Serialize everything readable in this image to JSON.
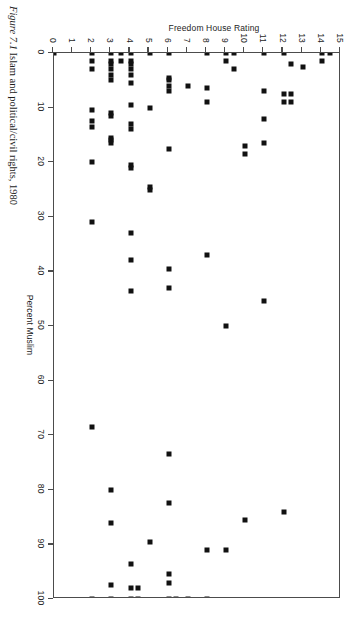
{
  "figure": {
    "caption_label": "Figure 7.1",
    "caption_text": "Islam and political/civil rights, 1980"
  },
  "chart_data": {
    "type": "scatter",
    "title": "",
    "xlabel": "Percent Muslim",
    "ylabel": "Freedom House Rating",
    "xlim": [
      0,
      100
    ],
    "ylim": [
      0,
      15
    ],
    "xticks": [
      0,
      10,
      20,
      30,
      40,
      50,
      60,
      70,
      80,
      90,
      100
    ],
    "xtick_labels": [
      "0",
      "10",
      "20",
      "30",
      "40",
      "50",
      "60",
      "70",
      "80",
      "90",
      "100"
    ],
    "yticks": [
      0,
      1,
      2,
      3,
      4,
      5,
      6,
      7,
      8,
      9,
      10,
      11,
      12,
      13,
      14,
      15
    ],
    "ytick_labels": [
      "0",
      "1",
      "2",
      "3",
      "4",
      "5",
      "6",
      "7",
      "8",
      "9",
      "10",
      "11",
      "12",
      "13",
      "14",
      "15"
    ],
    "grid": false,
    "legend": false,
    "marker": "square",
    "marker_color": "#111111",
    "frame_color": "#4c4c4c",
    "series": [
      {
        "name": "Countries",
        "points": [
          [
            0,
            0
          ],
          [
            0,
            2
          ],
          [
            0,
            3
          ],
          [
            0,
            3.5
          ],
          [
            0,
            4
          ],
          [
            0,
            5
          ],
          [
            0,
            6
          ],
          [
            0,
            8
          ],
          [
            0,
            9
          ],
          [
            0,
            9.4
          ],
          [
            0,
            11
          ],
          [
            0,
            12
          ],
          [
            0,
            14
          ],
          [
            0,
            14.4
          ],
          [
            1.5,
            2
          ],
          [
            1.5,
            3
          ],
          [
            1.5,
            3.5
          ],
          [
            1.5,
            4
          ],
          [
            1.5,
            9
          ],
          [
            1.5,
            14
          ],
          [
            2,
            3
          ],
          [
            2,
            4
          ],
          [
            2,
            12.4
          ],
          [
            2.5,
            13
          ],
          [
            3,
            2
          ],
          [
            3,
            3
          ],
          [
            3,
            4
          ],
          [
            3,
            9.4
          ],
          [
            4,
            3
          ],
          [
            4,
            4
          ],
          [
            4.5,
            6
          ],
          [
            5,
            3
          ],
          [
            5,
            6
          ],
          [
            5.5,
            4
          ],
          [
            6,
            6
          ],
          [
            6,
            7
          ],
          [
            6.5,
            8
          ],
          [
            7,
            6
          ],
          [
            7,
            11
          ],
          [
            7.5,
            12
          ],
          [
            7.5,
            12.4
          ],
          [
            9,
            8
          ],
          [
            9,
            12
          ],
          [
            9,
            12.4
          ],
          [
            9.5,
            4
          ],
          [
            10,
            5
          ],
          [
            10.5,
            2
          ],
          [
            11,
            3
          ],
          [
            11.5,
            3
          ],
          [
            12,
            11
          ],
          [
            12.5,
            2
          ],
          [
            13,
            4
          ],
          [
            13.5,
            2
          ],
          [
            14,
            4
          ],
          [
            15.5,
            3
          ],
          [
            16,
            3
          ],
          [
            16.5,
            3
          ],
          [
            16.5,
            11
          ],
          [
            17,
            10
          ],
          [
            17.5,
            6
          ],
          [
            18.5,
            10
          ],
          [
            20,
            2
          ],
          [
            20.5,
            4
          ],
          [
            21,
            4
          ],
          [
            24.5,
            5
          ],
          [
            25,
            5
          ],
          [
            31,
            2
          ],
          [
            33,
            4
          ],
          [
            37,
            8
          ],
          [
            38,
            4
          ],
          [
            39.5,
            6
          ],
          [
            43,
            6
          ],
          [
            43.5,
            4
          ],
          [
            45.5,
            11
          ],
          [
            50,
            9
          ],
          [
            68.5,
            2
          ],
          [
            73.5,
            6
          ],
          [
            80,
            3
          ],
          [
            82.5,
            6
          ],
          [
            84,
            12
          ],
          [
            85.5,
            10
          ],
          [
            86,
            3
          ],
          [
            89.5,
            5
          ],
          [
            91,
            9
          ],
          [
            91,
            8
          ],
          [
            93.5,
            4
          ],
          [
            95.5,
            6
          ],
          [
            97,
            6
          ],
          [
            97.5,
            3
          ],
          [
            98,
            4
          ],
          [
            98,
            4.4
          ],
          [
            100,
            2
          ],
          [
            100,
            3
          ],
          [
            100,
            4
          ],
          [
            100,
            4.4
          ],
          [
            100,
            6
          ],
          [
            100,
            6.4
          ],
          [
            100,
            7
          ],
          [
            100,
            8
          ]
        ]
      }
    ]
  }
}
